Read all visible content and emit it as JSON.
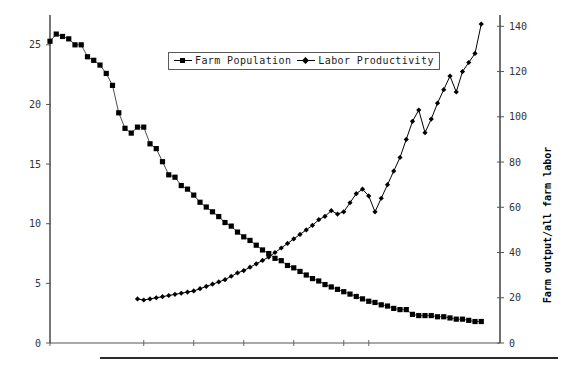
{
  "chart_data": {
    "type": "line",
    "title": "",
    "subtitle": "",
    "xlabel": "",
    "ylabel": "",
    "y2label": "Farm output/all farm labor",
    "grid": false,
    "legend_position": "top-center",
    "ylim": [
      0,
      27.5
    ],
    "y2lim": [
      0,
      145
    ],
    "xlim": [
      0,
      72
    ],
    "yticks": [
      0,
      5,
      10,
      15,
      20,
      25
    ],
    "yticklabels": [
      "0",
      "5",
      "10",
      "15",
      "20",
      "25"
    ],
    "y2ticks": [
      0,
      20,
      40,
      60,
      80,
      100,
      120,
      140
    ],
    "y2ticklabels": [
      "0",
      "20",
      "40",
      "60",
      "80",
      "100",
      "120",
      "140"
    ],
    "xticks": [
      0,
      15,
      23,
      31,
      39,
      47,
      51
    ],
    "xticklabels": [
      "",
      "",
      "",
      "",
      "",
      "",
      ""
    ],
    "series": [
      {
        "name": "Farm Population",
        "marker": "square",
        "axis": "left",
        "color": "#000000",
        "x": [
          0,
          1,
          2,
          3,
          4,
          5,
          6,
          7,
          8,
          9,
          10,
          11,
          12,
          13,
          14,
          15,
          16,
          17,
          18,
          19,
          20,
          21,
          22,
          23,
          24,
          25,
          26,
          27,
          28,
          29,
          30,
          31,
          32,
          33,
          34,
          35,
          36,
          37,
          38,
          39,
          40,
          41,
          42,
          43,
          44,
          45,
          46,
          47,
          48,
          49,
          50,
          51,
          52,
          53,
          54,
          55,
          56,
          57,
          58,
          59,
          60,
          61,
          62,
          63,
          64,
          65,
          66,
          67,
          68,
          69
        ],
        "values": [
          25.3,
          25.9,
          25.7,
          25.5,
          25.0,
          25.0,
          24.0,
          23.7,
          23.3,
          22.6,
          21.6,
          19.3,
          18.0,
          17.6,
          18.1,
          18.1,
          16.7,
          16.3,
          15.2,
          14.1,
          13.9,
          13.2,
          12.9,
          12.4,
          11.8,
          11.4,
          11.0,
          10.6,
          10.1,
          9.8,
          9.3,
          8.9,
          8.6,
          8.2,
          7.8,
          7.5,
          7.1,
          6.9,
          6.5,
          6.3,
          6.0,
          5.7,
          5.4,
          5.2,
          4.9,
          4.7,
          4.5,
          4.3,
          4.1,
          3.9,
          3.7,
          3.5,
          3.4,
          3.2,
          3.1,
          2.9,
          2.8,
          2.8,
          2.4,
          2.3,
          2.3,
          2.3,
          2.2,
          2.2,
          2.1,
          2.0,
          2.0,
          1.9,
          1.8,
          1.8
        ]
      },
      {
        "name": "Labor Productivity",
        "marker": "diamond",
        "axis": "right",
        "color": "#000000",
        "x": [
          14,
          15,
          16,
          17,
          18,
          19,
          20,
          21,
          22,
          23,
          24,
          25,
          26,
          27,
          28,
          29,
          30,
          31,
          32,
          33,
          34,
          35,
          36,
          37,
          38,
          39,
          40,
          41,
          42,
          43,
          44,
          45,
          46,
          47,
          48,
          49,
          50,
          51,
          52,
          53,
          54,
          55,
          56,
          57,
          58,
          59,
          60,
          61,
          62,
          63,
          64,
          65,
          66,
          67,
          68,
          69
        ],
        "values": [
          19.5,
          19.0,
          19.5,
          20.0,
          20.5,
          21.0,
          21.5,
          22.0,
          22.5,
          23.0,
          24.0,
          25.0,
          26.0,
          27.0,
          28.0,
          29.5,
          31.0,
          32.0,
          33.5,
          35.0,
          36.5,
          38.0,
          40.0,
          42.0,
          44.0,
          46.0,
          48.0,
          50.0,
          52.0,
          54.5,
          56.0,
          58.5,
          57.0,
          58.0,
          62.0,
          66.0,
          68.0,
          65.0,
          58.0,
          64.0,
          70.0,
          76.0,
          82.0,
          90.0,
          98.0,
          103.0,
          93.0,
          99.0,
          106.0,
          112.0,
          118.0,
          111.0,
          120.0,
          124.0,
          128.0,
          141.0
        ]
      }
    ]
  },
  "legend": {
    "entries": [
      {
        "label": "Farm Population",
        "marker": "square-marker"
      },
      {
        "label": "Labor Productivity",
        "marker": "diamond-marker"
      }
    ]
  },
  "axes": {
    "right_title": "Farm output/all farm labor"
  }
}
